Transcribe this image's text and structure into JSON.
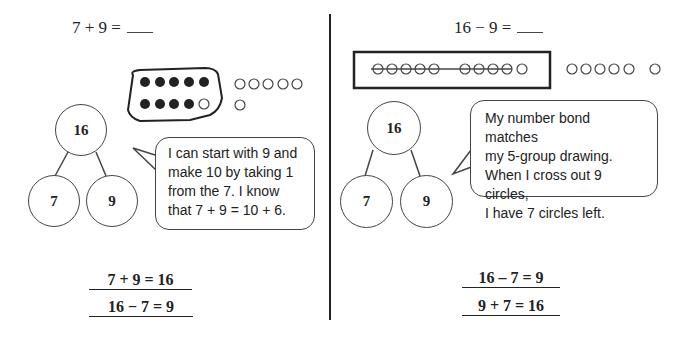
{
  "left_panel": {
    "problem": "7 + 9 =",
    "ten_frame": {
      "filled_dots": 9,
      "empty_dots_in_group": 1,
      "extra_circles_row1": 5,
      "extra_circles_row2": 1
    },
    "number_bond": {
      "whole": "16",
      "part_a": "7",
      "part_b": "9"
    },
    "speech": {
      "line1": "I can start with 9 and",
      "line2": "make 10 by taking 1",
      "line3": "from the 7.  I know",
      "line4": "that 7 + 9 = 10 + 6."
    },
    "equations": [
      "7 + 9 =  16",
      "16 −  7 = 9"
    ]
  },
  "right_panel": {
    "problem": "16 − 9 =",
    "five_group": {
      "crossed_out": 9,
      "in_box_total": 10,
      "outside_row": 5,
      "outside_single": 1
    },
    "number_bond": {
      "whole": "16",
      "part_a": "7",
      "part_b": "9"
    },
    "speech": {
      "line1": "My number bond matches",
      "line2": "my 5-group drawing.",
      "line3": "When I cross out 9 circles,",
      "line4": "I have 7 circles left."
    },
    "equations": [
      "16 – 7  = 9",
      "9 + 7  = 16"
    ]
  }
}
